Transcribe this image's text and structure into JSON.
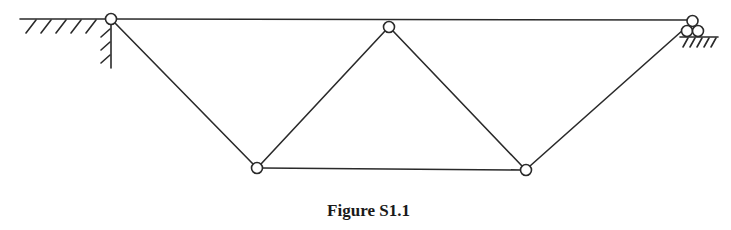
{
  "figure": {
    "caption": "Figure S1.1",
    "type": "truss",
    "colors": {
      "line": "#2a2a2a",
      "node_fill": "#ffffff",
      "background": "#ffffff"
    },
    "nodes": [
      {
        "id": "A",
        "x": 111,
        "y": 19,
        "role": "fixed-pin-support"
      },
      {
        "id": "B",
        "x": 389,
        "y": 27,
        "role": "top-joint"
      },
      {
        "id": "C",
        "x": 694,
        "y": 20,
        "role": "roller-support"
      },
      {
        "id": "D",
        "x": 257,
        "y": 168,
        "role": "bottom-joint"
      },
      {
        "id": "E",
        "x": 526,
        "y": 170,
        "role": "bottom-joint"
      }
    ],
    "members": [
      {
        "from": "A",
        "to": "C"
      },
      {
        "from": "A",
        "to": "D"
      },
      {
        "from": "D",
        "to": "B"
      },
      {
        "from": "B",
        "to": "E"
      },
      {
        "from": "D",
        "to": "E"
      },
      {
        "from": "E",
        "to": "C"
      }
    ],
    "supports": [
      {
        "node": "A",
        "kind": "fixed wall (hatched ground left and vertical wall below)"
      },
      {
        "node": "C",
        "kind": "roller (three rollers on hatched ground)"
      }
    ]
  }
}
